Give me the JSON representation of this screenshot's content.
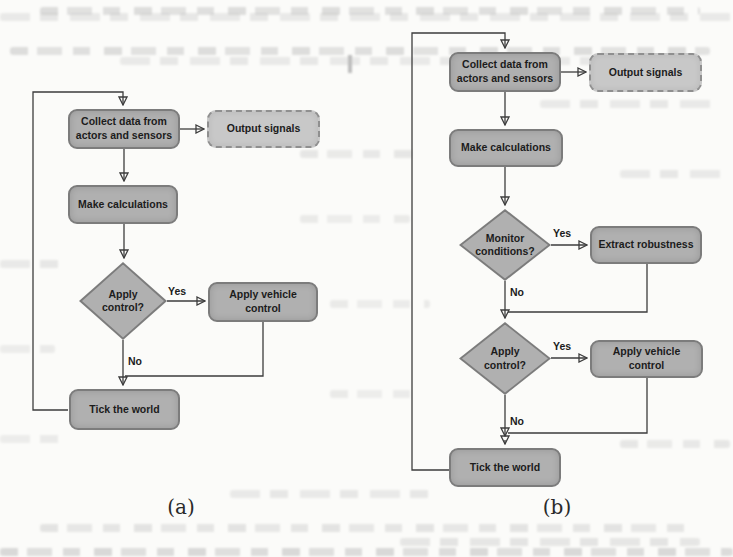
{
  "figures": [
    {
      "caption": "(a)",
      "nodes": {
        "collect": {
          "label": "Collect data from actors and sensors"
        },
        "output": {
          "label": "Output signals"
        },
        "make": {
          "label": "Make calculations"
        },
        "apply_q": {
          "label": "Apply control?"
        },
        "apply_vc": {
          "label": "Apply vehicle control"
        },
        "tick": {
          "label": "Tick the world"
        }
      },
      "labels": {
        "yes_apply": "Yes",
        "no_apply": "No"
      }
    },
    {
      "caption": "(b)",
      "nodes": {
        "collect": {
          "label": "Collect data from actors and sensors"
        },
        "output": {
          "label": "Output signals"
        },
        "make": {
          "label": "Make calculations"
        },
        "monitor_q": {
          "label": "Monitor conditions?"
        },
        "extract": {
          "label": "Extract robustness"
        },
        "apply_q": {
          "label": "Apply control?"
        },
        "apply_vc": {
          "label": "Apply vehicle control"
        },
        "tick": {
          "label": "Tick the world"
        }
      },
      "labels": {
        "yes_monitor": "Yes",
        "no_monitor": "No",
        "yes_apply": "Yes",
        "no_apply": "No"
      }
    }
  ],
  "colors": {
    "node_fill": "#b0b0b0",
    "node_border": "#7c7c7c",
    "dashed_fill": "#c8c8c8",
    "line": "#3d3d3d",
    "text": "#1c1c1c",
    "page": "#fbfbf9"
  }
}
